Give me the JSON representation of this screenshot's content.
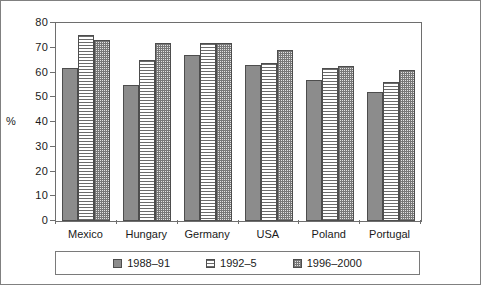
{
  "chart_data": {
    "type": "bar",
    "title": "",
    "xlabel": "",
    "ylabel": "%",
    "ylim": [
      0,
      80
    ],
    "yticks": [
      0,
      10,
      20,
      30,
      40,
      50,
      60,
      70,
      80
    ],
    "grid": false,
    "legend_position": "bottom",
    "categories": [
      "Mexico",
      "Hungary",
      "Germany",
      "USA",
      "Poland",
      "Portugal"
    ],
    "series": [
      {
        "name": "1988–91",
        "pattern": "solid-grey",
        "color": "#8c8c8c",
        "values": [
          62,
          55,
          67,
          63,
          57,
          52
        ]
      },
      {
        "name": "1992–5",
        "pattern": "horizontal-lines",
        "color": "#6b6b6b",
        "values": [
          75,
          65,
          72,
          64,
          62,
          56
        ]
      },
      {
        "name": "1996–2000",
        "pattern": "checker",
        "color": "#777777",
        "values": [
          73,
          72,
          72,
          69,
          62.5,
          61
        ]
      }
    ]
  }
}
